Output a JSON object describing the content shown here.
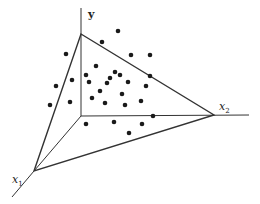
{
  "diagram": {
    "title": "",
    "axes": {
      "y": {
        "label": "y",
        "origin": [
          81,
          116
        ],
        "end": [
          81,
          8
        ],
        "label_pos": [
          88,
          18
        ]
      },
      "x1": {
        "label": "x",
        "subscript": "1",
        "vertex": [
          34,
          171
        ],
        "end": [
          12,
          197
        ],
        "label_pos": [
          12,
          183
        ]
      },
      "x2": {
        "label": "x",
        "subscript": "2",
        "vertex": [
          214,
          115
        ],
        "end": [
          249,
          115
        ],
        "label_pos": [
          219,
          110
        ]
      }
    },
    "plane_triangle": [
      [
        81,
        34
      ],
      [
        214,
        115
      ],
      [
        34,
        171
      ]
    ],
    "colors": {
      "line": "#333333",
      "dot": "#1a1a1a",
      "background": "#ffffff"
    },
    "points": [
      [
        118,
        31
      ],
      [
        102,
        42
      ],
      [
        66,
        54
      ],
      [
        131,
        55
      ],
      [
        150,
        55
      ],
      [
        96,
        66
      ],
      [
        56,
        86
      ],
      [
        72,
        80
      ],
      [
        86,
        75
      ],
      [
        110,
        78
      ],
      [
        115,
        72
      ],
      [
        120,
        75
      ],
      [
        128,
        82
      ],
      [
        89,
        82
      ],
      [
        107,
        83
      ],
      [
        100,
        91
      ],
      [
        150,
        76
      ],
      [
        92,
        98
      ],
      [
        70,
        102
      ],
      [
        50,
        105
      ],
      [
        122,
        94
      ],
      [
        105,
        103
      ],
      [
        125,
        105
      ],
      [
        141,
        101
      ],
      [
        146,
        86
      ],
      [
        86,
        124
      ],
      [
        114,
        122
      ],
      [
        142,
        124
      ],
      [
        129,
        133
      ],
      [
        153,
        116
      ]
    ]
  }
}
